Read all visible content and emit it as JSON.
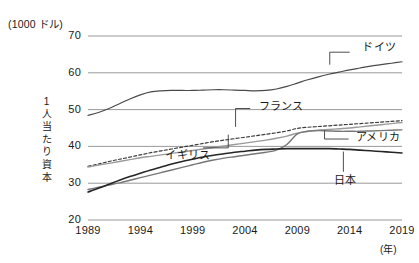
{
  "chart_data": {
    "type": "line",
    "title": "",
    "unit_label": "(1000 ドル)",
    "ylabel": "1人当たり資本",
    "ylabel_chars": [
      "1",
      "人",
      "当",
      "た",
      "り",
      "資",
      "本"
    ],
    "xlabel": "(年)",
    "x": [
      1989,
      1990,
      1991,
      1992,
      1993,
      1994,
      1995,
      1996,
      1997,
      1998,
      1999,
      2000,
      2001,
      2002,
      2003,
      2004,
      2005,
      2006,
      2007,
      2008,
      2009,
      2010,
      2011,
      2012,
      2013,
      2014,
      2015,
      2016,
      2017,
      2018,
      2019
    ],
    "xticks": [
      "1989",
      "1994",
      "1999",
      "2004",
      "2009",
      "2014",
      "2019"
    ],
    "xtick_values": [
      1989,
      1994,
      1999,
      2004,
      2009,
      2014,
      2019
    ],
    "yticks": [
      "20",
      "30",
      "40",
      "50",
      "60",
      "70"
    ],
    "ytick_values": [
      20,
      30,
      40,
      50,
      60,
      70
    ],
    "ylim": [
      20,
      70
    ],
    "xlim": [
      1989,
      2019
    ],
    "grid": "horizontal",
    "legend": "inline-annotations",
    "series": [
      {
        "name": "ドイツ",
        "name_en": "Germany",
        "color": "#4a4a4a",
        "style": "solid",
        "width": 1.2,
        "label_x": 2015.2,
        "label_y": 67.5,
        "leader": [
          [
            2014.0,
            65.6
          ],
          [
            2012.1,
            65.6
          ],
          [
            2012.1,
            62.2
          ]
        ],
        "values": [
          48.4,
          49.2,
          50.3,
          51.6,
          52.9,
          54.0,
          54.8,
          55.1,
          55.2,
          55.2,
          55.2,
          55.3,
          55.4,
          55.4,
          55.3,
          55.2,
          55.1,
          55.2,
          55.6,
          56.3,
          57.2,
          58.1,
          58.9,
          59.6,
          60.2,
          60.8,
          61.3,
          61.8,
          62.2,
          62.6,
          63.0
        ]
      },
      {
        "name": "フランス",
        "name_en": "France",
        "color": "#3c3c3c",
        "style": "dashed",
        "width": 1.2,
        "label_x": 2005.3,
        "label_y": 51.6,
        "leader": [
          [
            2004.5,
            50.3
          ],
          [
            2003.1,
            50.3
          ],
          [
            2003.1,
            45.3
          ]
        ],
        "values": [
          34.6,
          35.2,
          35.9,
          36.5,
          37.1,
          37.7,
          38.3,
          38.8,
          39.3,
          39.8,
          40.3,
          40.8,
          41.3,
          41.7,
          42.1,
          42.5,
          42.9,
          43.3,
          43.7,
          44.2,
          44.9,
          45.2,
          45.4,
          45.6,
          45.8,
          46.0,
          46.2,
          46.4,
          46.6,
          46.8,
          47.0
        ]
      },
      {
        "name": "イギリス",
        "name_en": "United Kingdom",
        "color": "#9a9a9a",
        "style": "solid",
        "width": 1.4,
        "label_x": 1996.4,
        "label_y": 38.3,
        "leader": [
          [
            2000.0,
            39.6
          ],
          [
            2002.4,
            39.6
          ],
          [
            2002.4,
            43.2
          ]
        ],
        "values": [
          34.4,
          34.9,
          35.4,
          35.9,
          36.4,
          36.9,
          37.3,
          37.7,
          38.1,
          38.5,
          38.9,
          39.3,
          39.7,
          40.1,
          40.5,
          40.9,
          41.3,
          41.7,
          42.2,
          42.8,
          43.6,
          44.1,
          44.4,
          44.6,
          44.8,
          45.0,
          45.3,
          45.6,
          45.9,
          46.2,
          46.5
        ]
      },
      {
        "name": "アメリカ",
        "name_en": "United States",
        "color": "#777777",
        "style": "solid",
        "width": 1.4,
        "label_x": 2014.6,
        "label_y": 43.2,
        "leader": [
          [
            2013.9,
            42.0
          ],
          [
            2011.6,
            42.0
          ],
          [
            2011.6,
            44.3
          ]
        ],
        "values": [
          28.3,
          28.9,
          29.5,
          30.1,
          30.8,
          31.5,
          32.2,
          32.9,
          33.6,
          34.3,
          35.0,
          35.7,
          36.3,
          36.8,
          37.2,
          37.6,
          38.0,
          38.4,
          39.0,
          40.5,
          43.4,
          44.1,
          44.3,
          44.2,
          44.1,
          44.1,
          44.1,
          44.2,
          44.3,
          44.4,
          44.5
        ]
      },
      {
        "name": "日本",
        "name_en": "Japan",
        "color": "#262626",
        "style": "solid",
        "width": 1.6,
        "label_x": 2012.5,
        "label_y": 31.5,
        "leader": [
          [
            2013.4,
            33.1
          ],
          [
            2013.4,
            38.6
          ]
        ],
        "values": [
          27.6,
          28.6,
          29.7,
          30.8,
          31.8,
          32.7,
          33.6,
          34.4,
          35.2,
          35.9,
          36.5,
          37.1,
          37.6,
          38.0,
          38.4,
          38.7,
          39.0,
          39.2,
          39.3,
          39.4,
          39.4,
          39.4,
          39.4,
          39.4,
          39.3,
          39.2,
          39.0,
          38.8,
          38.6,
          38.4,
          38.2
        ]
      }
    ]
  }
}
